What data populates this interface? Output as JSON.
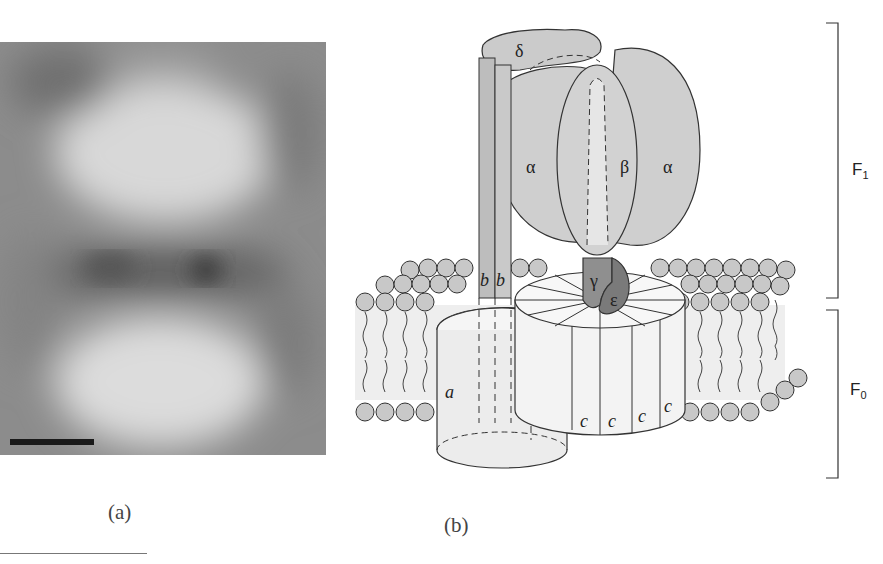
{
  "figure": {
    "panel_a": {
      "caption": "(a)",
      "description": "Electron micrograph image averaging of ATP synthase",
      "scale_bar": true,
      "colors": {
        "background": "#8a8a8a",
        "light_lobe": "#d9d9d9",
        "dark_band": "#5a5a5a"
      }
    },
    "panel_b": {
      "caption": "(b)",
      "subunit_labels": {
        "delta": "δ",
        "alpha_left": "α",
        "beta": "β",
        "alpha_right": "α",
        "gamma": "γ",
        "epsilon": "ε",
        "b1": "b",
        "b2": "b",
        "a": "a",
        "c1": "c",
        "c2": "c",
        "c3": "c",
        "c4": "c"
      },
      "brackets": {
        "f1": {
          "label": "F",
          "sub": "1"
        },
        "f0": {
          "label": "F",
          "sub": "0"
        }
      },
      "colors": {
        "headpiece": "#cfcfcf",
        "stalk_b": "#bdbdbd",
        "gamma": "#8f8f8f",
        "epsilon": "#7a7a7a",
        "c_ring": "#f3f3f3",
        "a_subunit": "#ececec",
        "lipid_head": "#c8c8c8",
        "membrane_core": "#efefef",
        "outline": "#333333"
      }
    }
  }
}
